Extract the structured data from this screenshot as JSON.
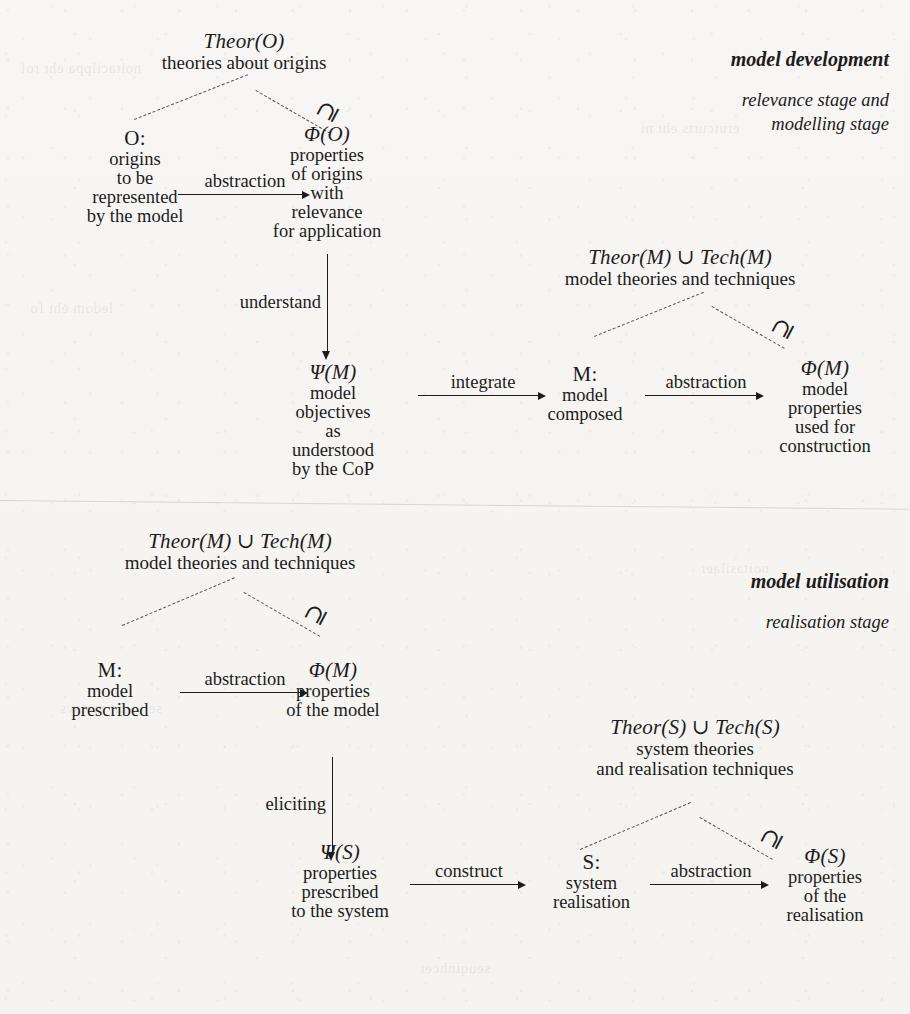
{
  "figure": {
    "background_color": "#f6f5f3",
    "ink_color": "#1c1c1c",
    "dash_color": "#55534f",
    "relation_symbol": "⊇"
  },
  "sections": [
    {
      "id": "model-development",
      "stage_title": "model development",
      "stage_sub_line1": "relevance stage and",
      "stage_sub_line2": "modelling stage",
      "universe": {
        "symbol": "Theor(O)",
        "description": "theories about origins"
      },
      "nodes": {
        "source": {
          "symbol": "O:",
          "lines": [
            "origins",
            "to be",
            "represented",
            "by the model"
          ]
        },
        "properties": {
          "symbol": "Φ(O)",
          "lines": [
            "properties",
            "of origins",
            "with",
            "relevance",
            "for application"
          ]
        },
        "objectives": {
          "symbol": "Ψ(M)",
          "lines": [
            "model",
            "objectives",
            "as",
            "understood",
            "by the CoP"
          ]
        },
        "model": {
          "symbol": "M:",
          "lines": [
            "model",
            "composed"
          ]
        },
        "model_properties": {
          "symbol": "Φ(M)",
          "lines": [
            "model",
            "properties",
            "used for",
            "construction"
          ]
        }
      },
      "universe2": {
        "symbol": "Theor(M) ∪ Tech(M)",
        "description": "model theories and techniques"
      },
      "arrows": {
        "abstraction_1": "abstraction",
        "understand": "understand",
        "integrate": "integrate",
        "abstraction_2": "abstraction"
      }
    },
    {
      "id": "model-utilisation",
      "stage_title": "model utilisation",
      "stage_sub_line1": "realisation stage",
      "universe": {
        "symbol": "Theor(M) ∪ Tech(M)",
        "description": "model theories and techniques"
      },
      "nodes": {
        "model": {
          "symbol": "M:",
          "lines": [
            "model",
            "prescribed"
          ]
        },
        "model_properties": {
          "symbol": "Φ(M)",
          "lines": [
            "properties",
            "of the model"
          ]
        },
        "prescribed_properties": {
          "symbol": "Ψ(S)",
          "lines": [
            "properties",
            "prescribed",
            "to the system"
          ]
        },
        "system": {
          "symbol": "S:",
          "lines": [
            "system",
            "realisation"
          ]
        },
        "system_properties": {
          "symbol": "Φ(S)",
          "lines": [
            "properties",
            "of the",
            "realisation"
          ]
        }
      },
      "universe2": {
        "symbol": "Theor(S) ∪ Tech(S)",
        "description_line1": "system theories",
        "description_line2": "and realisation techniques"
      },
      "arrows": {
        "abstraction_1": "abstraction",
        "eliciting": "eliciting",
        "construct": "construct",
        "abstraction_2": "abstraction"
      }
    }
  ]
}
